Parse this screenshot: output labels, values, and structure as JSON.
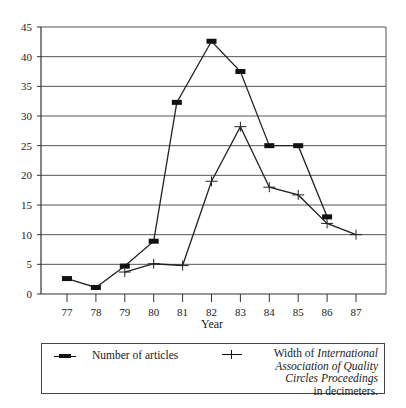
{
  "chart_data": {
    "type": "line",
    "title": "",
    "xlabel": "Year",
    "ylabel": "",
    "ylim": [
      0,
      45
    ],
    "y_ticks": [
      0,
      5,
      10,
      15,
      20,
      25,
      30,
      35,
      40,
      45
    ],
    "x_ticks": [
      "77",
      "78",
      "79",
      "80",
      "81",
      "82",
      "83",
      "84",
      "85",
      "86",
      "87"
    ],
    "grid": "horizontal",
    "legend_position": "bottom (boxed)",
    "series": [
      {
        "name": "Number of articles",
        "marker": "filled-rectangle",
        "points": [
          {
            "x": 77,
            "y": 2.6
          },
          {
            "x": 78,
            "y": 1.1
          },
          {
            "x": 79,
            "y": 4.7
          },
          {
            "x": 80,
            "y": 8.9
          },
          {
            "x": 80.8,
            "y": 32.3
          },
          {
            "x": 82,
            "y": 42.6
          },
          {
            "x": 83,
            "y": 37.5
          },
          {
            "x": 84,
            "y": 25
          },
          {
            "x": 85,
            "y": 25
          },
          {
            "x": 86,
            "y": 13
          }
        ]
      },
      {
        "name": "Width of International Association of Quality Circles Proceedings in decimeters.",
        "marker": "plus",
        "points": [
          {
            "x": 79,
            "y": 3.7
          },
          {
            "x": 80,
            "y": 5.1
          },
          {
            "x": 81,
            "y": 4.8
          },
          {
            "x": 82,
            "y": 19
          },
          {
            "x": 83,
            "y": 28.2
          },
          {
            "x": 84,
            "y": 18
          },
          {
            "x": 85,
            "y": 16.7
          },
          {
            "x": 86,
            "y": 11.9
          },
          {
            "x": 87,
            "y": 10
          }
        ]
      }
    ]
  },
  "legend": {
    "item1": "Number of articles",
    "item2_prefix": "Width of ",
    "item2_italic1": "International",
    "item2_italic2": "Association of Quality",
    "item2_italic3": "Circles Proceedings",
    "item2_suffix": "in decimeters."
  }
}
